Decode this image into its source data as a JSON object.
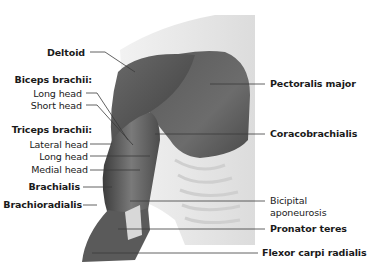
{
  "diagram": {
    "colors": {
      "background": "#ffffff",
      "muscle_dark": "#4a4a4a",
      "muscle_mid": "#6e6e6e",
      "skin_shadow": "#e6e6e6",
      "leader_line": "#3a3a3a",
      "text": "#1a1a1a"
    },
    "left_labels": {
      "deltoid": "Deltoid",
      "biceps_group": "Biceps brachii:",
      "biceps_long": "Long head",
      "biceps_short": "Short head",
      "triceps_group": "Triceps brachii:",
      "triceps_lateral": "Lateral head",
      "triceps_long": "Long head",
      "triceps_medial": "Medial head",
      "brachialis": "Brachialis",
      "brachioradialis": "Brachioradialis"
    },
    "right_labels": {
      "pectoralis": "Pectoralis major",
      "coracobrachialis": "Coracobrachialis",
      "bicipital_1": "Bicipital",
      "bicipital_2": "aponeurosis",
      "pronator": "Pronator teres",
      "flexor": "Flexor carpi radialis"
    }
  }
}
